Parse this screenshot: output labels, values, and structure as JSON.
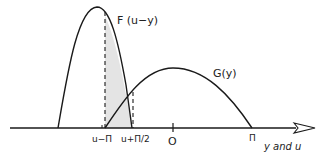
{
  "diagram": {
    "colors": {
      "stroke": "#1a1a1a",
      "shade": "#e4e4e4",
      "background": "#ffffff"
    },
    "curves": {
      "F": {
        "label": "F (u−y)",
        "description": "narrow peaked distribution"
      },
      "G": {
        "label": "G(y)",
        "description": "broad distribution from u−Π to Π"
      }
    },
    "axis": {
      "label": "y and u",
      "ticks": [
        {
          "id": "u-minus-pi",
          "label": "u−Π"
        },
        {
          "id": "u-plus-pi-half",
          "label": "u+Π/2"
        },
        {
          "id": "origin",
          "label": "O"
        },
        {
          "id": "pi",
          "label": "Π"
        }
      ]
    },
    "shaded_region": {
      "from": "u−Π",
      "to": "u+Π/2"
    }
  }
}
